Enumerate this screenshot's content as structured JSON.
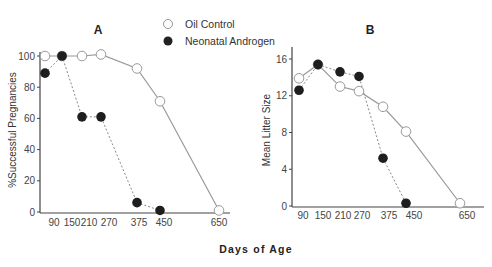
{
  "legend": {
    "items": [
      {
        "label": "Oil Control",
        "marker": "open-circle"
      },
      {
        "label": "Neonatal Androgen",
        "marker": "filled-circle"
      }
    ]
  },
  "shared_xlabel": "Days of Age",
  "chart_data": [
    {
      "type": "line",
      "title": "A",
      "xlabel": "Days of Age",
      "ylabel": "%Successful Pregnancies",
      "x": [
        90,
        150,
        210,
        270,
        375,
        450,
        650
      ],
      "x_tick_labels": [
        "90",
        "150",
        "210",
        "270",
        "375",
        "450",
        "650"
      ],
      "y_tick_labels": [
        "0",
        "20",
        "40",
        "60",
        "80",
        "100"
      ],
      "ylim": [
        0,
        100
      ],
      "grid": false,
      "legend_position": "top-center",
      "series": [
        {
          "name": "Oil Control",
          "style": "solid",
          "marker": "open-circle",
          "x": [
            90,
            150,
            210,
            270,
            375,
            450,
            650
          ],
          "values": [
            100,
            100,
            100,
            101,
            92,
            71,
            1
          ]
        },
        {
          "name": "Neonatal Androgen",
          "style": "dashed",
          "marker": "filled-circle",
          "x": [
            90,
            150,
            210,
            270,
            375,
            450
          ],
          "values": [
            89,
            100,
            61,
            61,
            6,
            1
          ]
        }
      ]
    },
    {
      "type": "line",
      "title": "B",
      "xlabel": "Days of Age",
      "ylabel": "Mean Litter Size",
      "x": [
        90,
        150,
        210,
        270,
        375,
        450,
        650
      ],
      "x_tick_labels": [
        "90",
        "150",
        "210",
        "270",
        "375",
        "450",
        "650"
      ],
      "y_tick_labels": [
        "0",
        "4",
        "8",
        "12",
        "16"
      ],
      "ylim": [
        0,
        16
      ],
      "grid": false,
      "series": [
        {
          "name": "Oil Control",
          "style": "solid",
          "marker": "open-circle",
          "x": [
            90,
            150,
            210,
            270,
            375,
            450,
            650
          ],
          "values": [
            13.9,
            15.4,
            13.0,
            12.5,
            10.8,
            8.1,
            0.3
          ]
        },
        {
          "name": "Neonatal Androgen",
          "style": "dashed",
          "marker": "filled-circle",
          "x": [
            90,
            150,
            210,
            270,
            375,
            450
          ],
          "values": [
            12.6,
            15.4,
            14.6,
            14.1,
            5.2,
            0.3
          ]
        }
      ]
    }
  ]
}
